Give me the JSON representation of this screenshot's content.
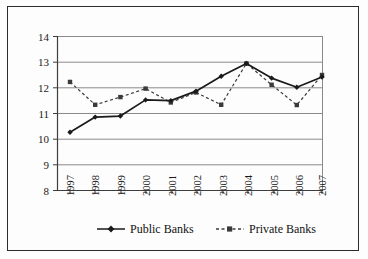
{
  "chart_data": {
    "type": "line",
    "title": "",
    "xlabel": "",
    "ylabel": "",
    "categories": [
      "1997",
      "1998",
      "1999",
      "2000",
      "2001",
      "2002",
      "2003",
      "2004",
      "2005",
      "2006",
      "2007"
    ],
    "series": [
      {
        "name": "Public Banks",
        "marker": "diamond",
        "linestyle": "solid",
        "color": "#1a1a1a",
        "values": [
          10.27,
          10.86,
          10.9,
          11.53,
          11.5,
          11.87,
          12.45,
          12.95,
          12.38,
          12.02,
          12.42
        ]
      },
      {
        "name": "Private Banks",
        "marker": "square",
        "linestyle": "dashed",
        "color": "#3a3a3a",
        "values": [
          12.23,
          11.34,
          11.64,
          11.97,
          11.43,
          11.82,
          11.34,
          12.95,
          12.12,
          11.33,
          12.5
        ]
      }
    ],
    "ylim": [
      8,
      14
    ],
    "yticks": [
      "8",
      "9",
      "10",
      "11",
      "12",
      "13",
      "14"
    ],
    "grid": true,
    "legend_position": "bottom"
  },
  "legend": {
    "items": [
      {
        "label": "Public Banks"
      },
      {
        "label": "Private Banks"
      }
    ]
  },
  "axis": {
    "y_tick_labels": [
      "14",
      "13",
      "12",
      "11",
      "10",
      "9",
      "8"
    ],
    "x_tick_labels": [
      "1997",
      "1998",
      "1999",
      "2000",
      "2001",
      "2002",
      "2003",
      "2004",
      "2005",
      "2006",
      "2007"
    ]
  },
  "colors": {
    "frame": "#2b2b2b",
    "gridline": "#8a8a8a",
    "axis": "#3d3d3d",
    "public_series": "#1a1a1a",
    "private_series": "#3a3a3a",
    "background": "#fdfdfd"
  }
}
